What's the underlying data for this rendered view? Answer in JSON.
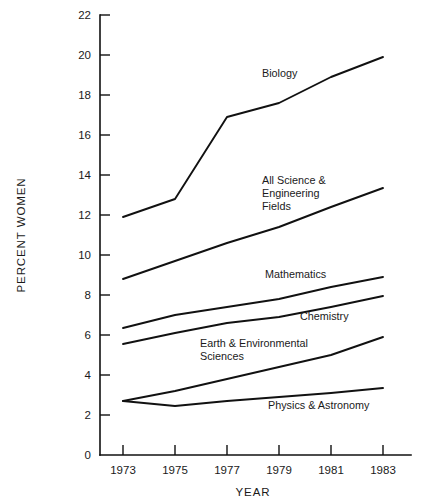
{
  "chart_data": {
    "type": "line",
    "title": "",
    "xlabel": "YEAR",
    "ylabel": "PERCENT WOMEN",
    "x": [
      1973,
      1975,
      1977,
      1979,
      1981,
      1983
    ],
    "xtick_labels": [
      "1973",
      "1975",
      "1977",
      "1979",
      "1981",
      "1983"
    ],
    "ytick_labels": [
      "0",
      "2",
      "4",
      "6",
      "8",
      "10",
      "12",
      "14",
      "16",
      "18",
      "20",
      "22"
    ],
    "ytick_values": [
      0,
      2,
      4,
      6,
      8,
      10,
      12,
      14,
      16,
      18,
      20,
      22
    ],
    "xlim": [
      1973,
      1983
    ],
    "ylim": [
      0,
      22
    ],
    "grid": false,
    "legend_position": "inline-labels",
    "series": [
      {
        "name": "Biology",
        "label": "Biology",
        "label_lines": [
          "Biology"
        ],
        "values": [
          11.9,
          12.8,
          16.9,
          17.6,
          18.9,
          19.9
        ]
      },
      {
        "name": "All Science & Engineering Fields",
        "label": "All Science & Engineering Fields",
        "label_lines": [
          "All Science &",
          "Engineering",
          "Fields"
        ],
        "values": [
          8.8,
          9.7,
          10.6,
          11.4,
          12.4,
          13.35
        ]
      },
      {
        "name": "Mathematics",
        "label": "Mathematics",
        "label_lines": [
          "Mathematics"
        ],
        "values": [
          6.35,
          7.0,
          7.4,
          7.8,
          8.4,
          8.9
        ]
      },
      {
        "name": "Chemistry",
        "label": "Chemistry",
        "label_lines": [
          "Chemistry"
        ],
        "values": [
          5.55,
          6.1,
          6.6,
          6.9,
          7.4,
          7.95
        ]
      },
      {
        "name": "Earth & Environmental Sciences",
        "label": "Earth & Environmental Sciences",
        "label_lines": [
          "Earth & Environmental",
          "Sciences"
        ],
        "values": [
          2.7,
          3.2,
          3.8,
          4.4,
          5.0,
          5.9
        ]
      },
      {
        "name": "Physics & Astronomy",
        "label": "Physics & Astronomy",
        "label_lines": [
          "Physics & Astronomy"
        ],
        "values": [
          2.7,
          2.45,
          2.7,
          2.9,
          3.1,
          3.35
        ]
      }
    ],
    "colors": {
      "line": "#111111",
      "axis": "#111111",
      "text": "#1a1a1a",
      "background": "#ffffff"
    },
    "annotations": [
      {
        "text": "Biology",
        "series": "Biology"
      },
      {
        "text": "All Science & Engineering Fields",
        "series": "All Science & Engineering Fields"
      },
      {
        "text": "Mathematics",
        "series": "Mathematics"
      },
      {
        "text": "Chemistry",
        "series": "Chemistry"
      },
      {
        "text": "Earth & Environmental Sciences",
        "series": "Earth & Environmental Sciences"
      },
      {
        "text": "Physics & Astronomy",
        "series": "Physics & Astronomy"
      }
    ]
  },
  "label_positions": {
    "biology": {
      "x": 262,
      "y": 77
    },
    "all_science": {
      "x": 262,
      "y": 184
    },
    "mathematics": {
      "x": 265,
      "y": 278
    },
    "chemistry": {
      "x": 300,
      "y": 320
    },
    "earth_env": {
      "x": 200,
      "y": 347
    },
    "physics": {
      "x": 268,
      "y": 409
    }
  }
}
